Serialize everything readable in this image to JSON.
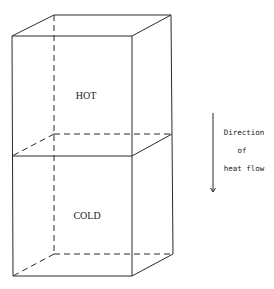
{
  "diagram": {
    "type": "stacked-cubes-heat-flow",
    "regions": {
      "top": {
        "label": "HOT"
      },
      "bottom": {
        "label": "COLD"
      }
    },
    "arrow": {
      "lines": [
        "Direction",
        "of",
        "heat flow"
      ],
      "direction": "down"
    }
  }
}
